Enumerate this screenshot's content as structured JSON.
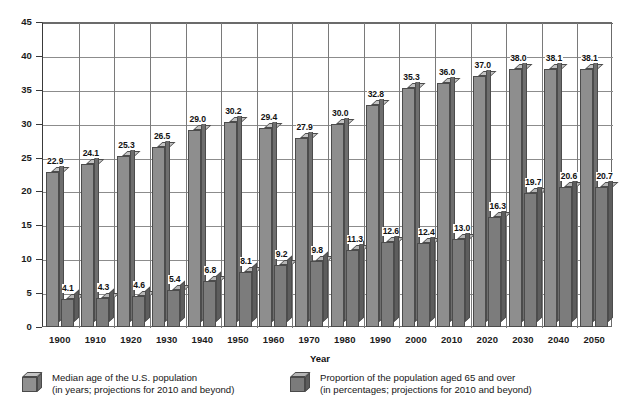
{
  "chart_data": {
    "type": "bar",
    "title": "",
    "xlabel": "Year",
    "ylabel": "",
    "ylim": [
      0,
      45
    ],
    "yticks": [
      0,
      5,
      10,
      15,
      20,
      25,
      30,
      35,
      40,
      45
    ],
    "grid": true,
    "legend_position": "bottom",
    "categories": [
      "1900",
      "1910",
      "1920",
      "1930",
      "1940",
      "1950",
      "1960",
      "1970",
      "1980",
      "1990",
      "2000",
      "2010",
      "2020",
      "2030",
      "2040",
      "2050"
    ],
    "series": [
      {
        "name": "Median age of the U.S. population",
        "unit": "years",
        "values": [
          22.9,
          24.1,
          25.3,
          26.5,
          29.0,
          30.2,
          29.4,
          27.9,
          30.0,
          32.8,
          35.3,
          36.0,
          37.0,
          38.0,
          38.1,
          38.1
        ],
        "labels": [
          "22.9",
          "24.1",
          "25.3",
          "26.5",
          "29.0",
          "30.2",
          "29.4",
          "27.9",
          "30.0",
          "32.8",
          "35.3",
          "36.0",
          "37.0",
          "38.0",
          "38.1",
          "38.1"
        ],
        "color": "#8e8e8e"
      },
      {
        "name": "Proportion of the population aged 65 and over",
        "unit": "percent",
        "values": [
          4.1,
          4.3,
          4.6,
          5.4,
          6.8,
          8.1,
          9.2,
          9.8,
          11.3,
          12.6,
          12.4,
          13.0,
          16.3,
          19.7,
          20.6,
          20.7
        ],
        "labels": [
          "4.1",
          "4.3",
          "4.6",
          "5.4",
          "6.8",
          "8.1",
          "9.2",
          "9.8",
          "11.3",
          "12.6",
          "12.4",
          "13.0",
          "16.3",
          "19.7",
          "20.6",
          "20.7"
        ],
        "color": "#7c7c7c"
      }
    ]
  },
  "axis": {
    "x_title": "Year",
    "y_tick_labels": [
      "45",
      "40",
      "35",
      "30",
      "25",
      "20",
      "15",
      "10",
      "5",
      "0"
    ],
    "x_tick_labels": [
      "1900",
      "1910",
      "1920",
      "1930",
      "1940",
      "1950",
      "1960",
      "1970",
      "1980",
      "1990",
      "2000",
      "2010",
      "2020",
      "2030",
      "2040",
      "2050"
    ]
  },
  "legend": {
    "items": [
      {
        "line1": "Median age of the U.S. population",
        "line2": "(in years; projections for 2010 and beyond)",
        "swatch": "light-cube-icon"
      },
      {
        "line1": "Proportion of the population aged 65 and over",
        "line2": "(in percentages; projections for 2010 and beyond)",
        "swatch": "dark-cube-icon"
      }
    ]
  },
  "colors": {
    "bar_light_front": "#8e8e8e",
    "bar_light_top": "#c3c3c3",
    "bar_light_side": "#6e6e6e",
    "bar_dark_front": "#7c7c7c",
    "bar_dark_top": "#b5b5b5",
    "bar_dark_side": "#5d5d5d",
    "grid": "#8c8c8c",
    "axis": "#3a3a3a",
    "text": "#1a1a1a",
    "background": "#ffffff"
  }
}
